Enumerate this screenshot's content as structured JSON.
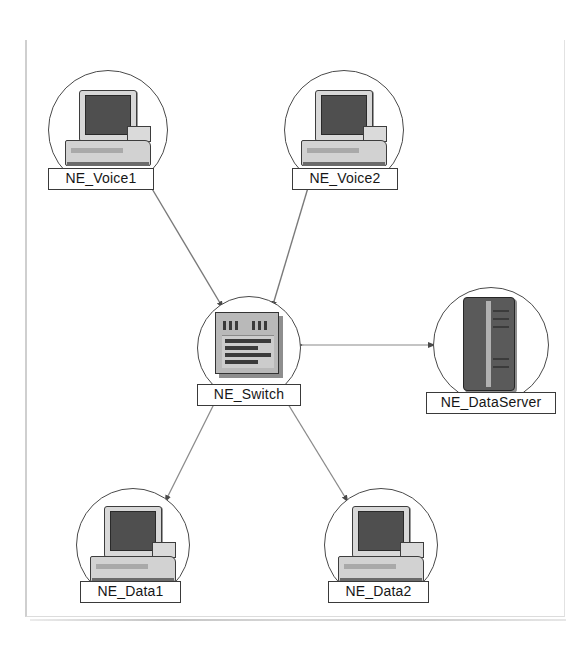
{
  "diagram": {
    "background_color": "#ffffff",
    "line_color": "#6e6e6e",
    "node_outline_color": "#4a4a4a",
    "label_border_color": "#3a3a3a",
    "nodes": [
      {
        "id": "ne-voice1",
        "label": "NE_Voice1",
        "icon": "desktop-computer-icon",
        "circle": {
          "cx": 108,
          "cy": 130,
          "r": 60
        }
      },
      {
        "id": "ne-voice2",
        "label": "NE_Voice2",
        "icon": "desktop-computer-icon",
        "circle": {
          "cx": 344,
          "cy": 130,
          "r": 60
        }
      },
      {
        "id": "ne-switch",
        "label": "NE_Switch",
        "icon": "network-switch-icon",
        "circle": {
          "cx": 249,
          "cy": 348,
          "r": 52
        }
      },
      {
        "id": "ne-dataserver",
        "label": "NE_DataServer",
        "icon": "server-tower-icon",
        "circle": {
          "cx": 491,
          "cy": 345,
          "r": 58
        }
      },
      {
        "id": "ne-data1",
        "label": "NE_Data1",
        "icon": "desktop-computer-icon",
        "circle": {
          "cx": 133,
          "cy": 545,
          "r": 57
        }
      },
      {
        "id": "ne-data2",
        "label": "NE_Data2",
        "icon": "desktop-computer-icon",
        "circle": {
          "cx": 381,
          "cy": 545,
          "r": 57
        }
      }
    ],
    "links": [
      {
        "id": "link-voice1-switch",
        "from": "ne-voice1",
        "to": "ne-switch",
        "direction": "one-way"
      },
      {
        "id": "link-voice2-switch",
        "from": "ne-voice2",
        "to": "ne-switch",
        "direction": "one-way"
      },
      {
        "id": "link-switch-dataserver",
        "from": "ne-switch",
        "to": "ne-dataserver",
        "direction": "two-way"
      },
      {
        "id": "link-switch-data1",
        "from": "ne-switch",
        "to": "ne-data1",
        "direction": "one-way"
      },
      {
        "id": "link-switch-data2",
        "from": "ne-switch",
        "to": "ne-data2",
        "direction": "one-way"
      }
    ]
  }
}
